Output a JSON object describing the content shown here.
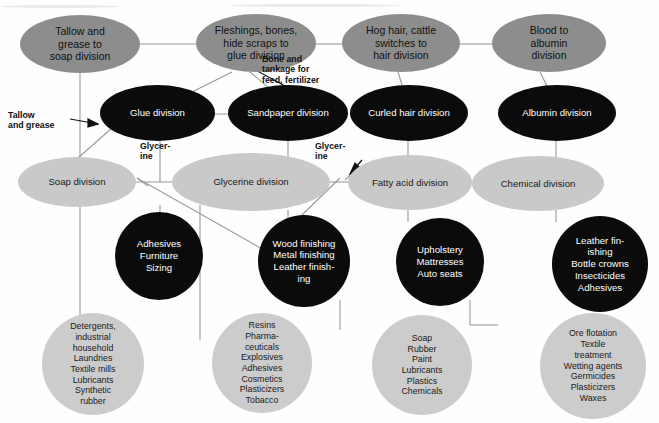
{
  "diagram": {
    "colors": {
      "row1_fill": "#8d8d8d",
      "row2_fill": "#0b0b0b",
      "row3_fill": "#c9c9c9",
      "row4_fill": "#0b0b0b",
      "row5_fill": "#cccccc",
      "line": "#9a9a9a",
      "arrow": "#111111",
      "text_dark": "#111111",
      "text_light": "#ffffff"
    },
    "row1": [
      {
        "id": "tallow-grease-soap",
        "label": "Tallow and\ngrease to\nsoap division"
      },
      {
        "id": "fleshings-bones-glue",
        "label": "Fleshings, bones,\nhide scraps to\nglue division"
      },
      {
        "id": "hog-hair-cattle",
        "label": "Hog hair, cattle\nswitches to\nhair division"
      },
      {
        "id": "blood-albumin",
        "label": "Blood to\nalbumin\ndivision"
      }
    ],
    "row2": [
      {
        "id": "glue-division",
        "label": "Glue division"
      },
      {
        "id": "sandpaper-division",
        "label": "Sandpaper division"
      },
      {
        "id": "curled-hair-division",
        "label": "Curled hair division"
      },
      {
        "id": "albumin-division",
        "label": "Albumin division"
      }
    ],
    "row3": [
      {
        "id": "soap-division",
        "label": "Soap division"
      },
      {
        "id": "glycerine-division",
        "label": "Glycerine division"
      },
      {
        "id": "fatty-acid-division",
        "label": "Fatty acid division"
      },
      {
        "id": "chemical-division",
        "label": "Chemical division"
      }
    ],
    "row4": [
      {
        "id": "adhesives-group",
        "label": "Adhesives\nFurniture\nSizing"
      },
      {
        "id": "wood-finishing-group",
        "label": "Wood finishing\nMetal finishing\nLeather finish-\ning"
      },
      {
        "id": "upholstery-group",
        "label": "Upholstery\nMattresses\nAuto seats"
      },
      {
        "id": "leather-finishing-group",
        "label": "Leather fin-\nishing\nBottle crowns\nInsecticides\nAdhesives"
      }
    ],
    "row5": [
      {
        "id": "detergents-group",
        "label": "Detergents,\n  industrial\n  household\nLaundries\nTextile mills\nLubricants\nSynthetic\n  rubber"
      },
      {
        "id": "resins-group",
        "label": "Resins\nPharma-\n  ceuticals\nExplosives\nAdhesives\nCosmetics\nPlasticizers\nTobacco"
      },
      {
        "id": "soap-rubber-group",
        "label": "Soap\nRubber\nPaint\nLubricants\nPlastics\nChemicals"
      },
      {
        "id": "ore-flotation-group",
        "label": "Ore flotation\nTextile\n  treatment\nWetting agents\nGermicides\nPlasticizers\nWaxes"
      }
    ],
    "edge_labels": [
      {
        "id": "tallow-and-grease",
        "text": "Tallow\nand grease"
      },
      {
        "id": "bone-and-tankage",
        "text": "Bone and\ntankage for\nfeed, fertilizer"
      },
      {
        "id": "glycerine-left",
        "text": "Glycer-\nine"
      },
      {
        "id": "glycerine-right",
        "text": "Glycer-\nine"
      }
    ]
  }
}
